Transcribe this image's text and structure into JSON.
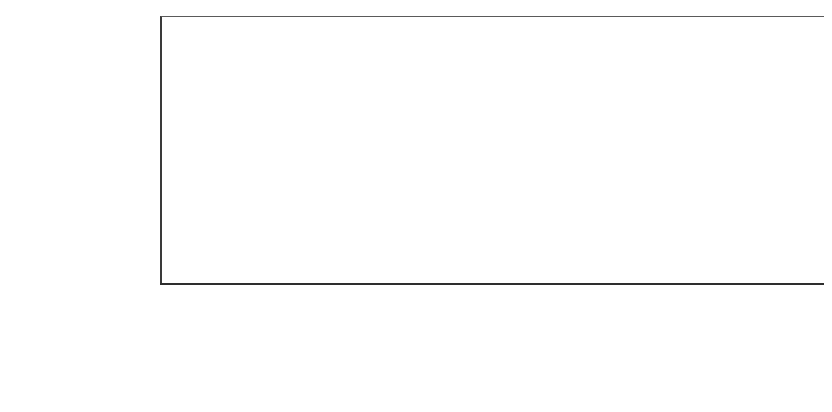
{
  "chart_data": {
    "type": "bar",
    "stacked": true,
    "title": "",
    "xlabel": "",
    "ylabel": "",
    "unit_note": "（单位：GW）",
    "grid": true,
    "legend_position": "table-row-labels",
    "ylim": [
      0,
      300
    ],
    "categories": [
      "2005",
      "2006",
      "2007",
      "2008",
      "2009",
      "2010",
      "2011",
      "2012",
      "2013",
      "2014",
      "2015"
    ],
    "ytick_labels": [
      "300",
      "150",
      "200",
      "150",
      "100",
      "50",
      "0"
    ],
    "ytick_values": [
      300,
      250,
      200,
      150,
      100,
      50,
      0
    ],
    "series": [
      {
        "name": "前一年总容量",
        "color": "#a3a3a3",
        "stack_position": "bottom",
        "values": [
          5.1,
          6.7,
          9,
          16,
          28,
          40,
          70,
          100,
          138,
          177,
          227
        ]
      },
      {
        "name": "年新增容量",
        "color": "#4c4c4c",
        "stack_position": "top",
        "values": [
          1.4,
          1.4,
          2.5,
          6.5,
          8,
          16.8,
          30,
          29,
          38,
          40,
          50
        ]
      }
    ],
    "totals": [
      6.5,
      8.1,
      11.5,
      22.5,
      36,
      56.8,
      100,
      129,
      176,
      217,
      277
    ]
  },
  "table": {
    "header_row_label": "",
    "years": [
      "2005",
      "2006",
      "2007",
      "2008",
      "2009",
      "2010",
      "2011",
      "2012",
      "2013",
      "2014",
      "2015"
    ],
    "rows": [
      {
        "label": "年新增容量",
        "swatch": "dark",
        "values": [
          "1.4",
          "1.4",
          "2.5",
          "6.5",
          "8",
          "16.8",
          "30",
          "29",
          "38",
          "40",
          "50"
        ]
      },
      {
        "label": "前一年总容量",
        "swatch": "light",
        "values": [
          "5.1",
          "6.7",
          "9",
          "16",
          "28",
          "40",
          "70",
          "100",
          "138",
          "177",
          "227"
        ]
      }
    ]
  },
  "footer": {
    "unit": "（单位：GW）"
  },
  "colors": {
    "series_new_capacity": "#4c4c4c",
    "series_prev_total": "#a3a3a3",
    "axis": "#3a3a3a",
    "gridline": "#6e6e6e",
    "background": "#ffffff"
  }
}
